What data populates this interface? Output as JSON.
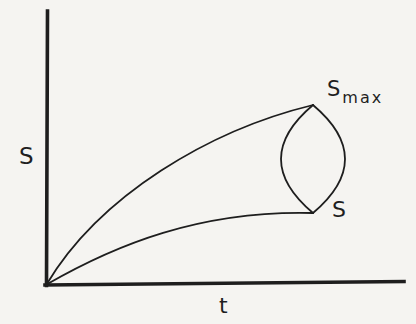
{
  "canvas": {
    "width": 416,
    "height": 324,
    "background": "#f5f4f1",
    "ink": "#1e1e1e"
  },
  "labels": {
    "y_axis": {
      "text": "S",
      "x": 19,
      "y": 145,
      "size": 23
    },
    "x_axis": {
      "text": "t",
      "x": 219,
      "y": 295,
      "size": 22
    },
    "s_max": {
      "base": "S",
      "sub": "max",
      "x": 327,
      "y": 79,
      "size": 21,
      "sub_size": 16,
      "sub_dx": 2,
      "sub_dy": 7
    },
    "s_end": {
      "text": "S",
      "x": 332,
      "y": 199,
      "size": 22
    }
  },
  "chart_data": {
    "type": "line",
    "title": "",
    "xlabel": "t",
    "ylabel": "S",
    "x_ticks": [],
    "y_ticks": [],
    "grid": false,
    "legend": false,
    "qualitative": true,
    "annotations": [
      {
        "text": "S_max",
        "attached_to": "upper curve endpoint"
      },
      {
        "text": "S",
        "attached_to": "lower curve endpoint"
      }
    ],
    "series": [
      {
        "name": "upper envelope (to S_max)",
        "points_normalized": [
          [
            0.0,
            0.0
          ],
          [
            0.145,
            0.238
          ],
          [
            0.318,
            0.469
          ],
          [
            0.542,
            0.575
          ],
          [
            0.746,
            0.659
          ]
        ]
      },
      {
        "name": "lower envelope (to S)",
        "points_normalized": [
          [
            0.0,
            0.0
          ],
          [
            0.215,
            0.132
          ],
          [
            0.327,
            0.19
          ],
          [
            0.48,
            0.249
          ],
          [
            0.654,
            0.264
          ],
          [
            0.746,
            0.264
          ]
        ]
      },
      {
        "name": "lens left arc",
        "points_normalized": [
          [
            0.746,
            0.659
          ],
          [
            0.656,
            0.462
          ],
          [
            0.746,
            0.264
          ]
        ]
      },
      {
        "name": "lens right arc",
        "points_normalized": [
          [
            0.746,
            0.659
          ],
          [
            0.835,
            0.462
          ],
          [
            0.746,
            0.264
          ]
        ]
      }
    ],
    "geometry": {
      "stroke": "#1e1e1e",
      "axes": [
        {
          "name": "y-axis",
          "x1": 47.5,
          "y1": 11,
          "x2": 46.5,
          "y2": 285.5,
          "width": 3.6
        },
        {
          "name": "x-axis",
          "x1": 45,
          "y1": 285,
          "x2": 404,
          "y2": 281.5,
          "width": 3.6
        }
      ],
      "paths": [
        {
          "name": "upper-curve",
          "d": "M 46.5 284.5 C 100 195 210 130 313 105",
          "width": 1.8
        },
        {
          "name": "lower-curve",
          "d": "M 46.5 284.5 C 115 245 200 210 313 213",
          "width": 1.8
        },
        {
          "name": "lens-left-arc",
          "d": "M 313 105 Q 249 159 313 213",
          "width": 1.8
        },
        {
          "name": "lens-right-arc",
          "d": "M 313 105 Q 377 159 313 213",
          "width": 1.8
        }
      ]
    }
  }
}
